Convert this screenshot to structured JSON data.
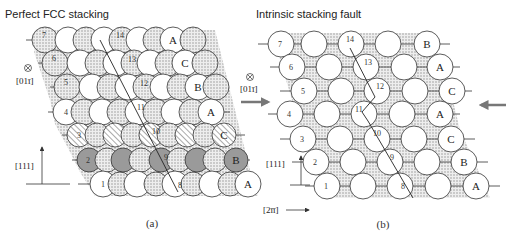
{
  "panels": [
    {
      "id": "a",
      "title": "Perfect FCC stacking",
      "caption": "(a)",
      "direction_out_of_page": "[01ī]",
      "vertical_axis": "[111]",
      "stacking_letters": [
        "A",
        "B",
        "C",
        "A",
        "B",
        "C",
        "A"
      ],
      "layer_numbers": [
        "1",
        "2",
        "3",
        "4",
        "5",
        "6",
        "7"
      ],
      "burgers_path_numbers": [
        "8",
        "9",
        "10",
        "11",
        "12",
        "13",
        "14"
      ],
      "layer_styles": [
        "white",
        "gray",
        "hatched",
        "white",
        "dotted",
        "dotted",
        "dotted"
      ]
    },
    {
      "id": "b",
      "title": "Intrinsic stacking fault",
      "caption": "(b)",
      "direction_out_of_page": "[01ī]",
      "vertical_axis": "[111]",
      "horizontal_axis": "[2īī]",
      "stacking_letters": [
        "A",
        "B",
        "C",
        "A",
        "C",
        "A",
        "B"
      ],
      "layer_numbers": [
        "1",
        "2",
        "3",
        "4",
        "5",
        "6",
        "7"
      ],
      "burgers_path_numbers": [
        "8",
        "9",
        "10",
        "11",
        "12",
        "13",
        "14"
      ],
      "shear_arrows": [
        "left-arrow-pointing-right",
        "right-arrow-pointing-left"
      ]
    }
  ],
  "colors": {
    "atom_white": "#ffffff",
    "atom_gray": "#9a9a9a",
    "dotted_fill": "#d8d8d8",
    "stroke": "#333333",
    "arrow": "#777777"
  }
}
